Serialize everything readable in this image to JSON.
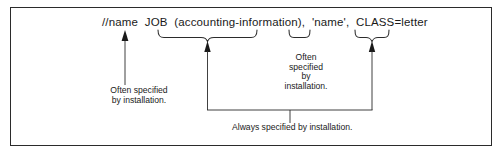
{
  "figure": {
    "border_color": "#2b2b2b",
    "text_color": "#1a1a1a",
    "background": "#ffffff"
  },
  "syntax": {
    "line": "//name  JOB  (accounting-information),  'name',  CLASS=letter",
    "tokens": [
      {
        "text": "//name",
        "role": "jobname-field"
      },
      {
        "text": "JOB",
        "role": "operation-field"
      },
      {
        "text": "(accounting-information),",
        "role": "accounting-information-operand"
      },
      {
        "text": "'name',",
        "role": "programmer-name-operand"
      },
      {
        "text": "CLASS=letter",
        "role": "class-operand"
      }
    ]
  },
  "annotations": {
    "name_note": "Often specified\nby installation.",
    "jobname_note": "Often\nspecified\nby\ninstallation.",
    "always_note": "Always specified by installation."
  },
  "connectors": {
    "name_arrow": "arrow-up-to-name",
    "accounting_brace": "brace-under-accounting-information",
    "programmer_brace": "brace-under-programmer-name",
    "class_brace": "brace-under-class",
    "always_bracket": "bracket-joining-accounting-and-class"
  }
}
